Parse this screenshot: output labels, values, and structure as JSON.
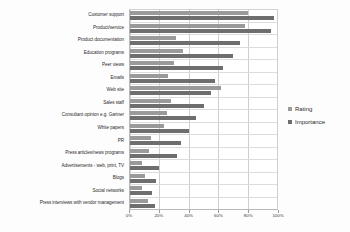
{
  "chart_data": {
    "type": "bar",
    "orientation": "horizontal",
    "title": "",
    "xlabel": "",
    "ylabel": "",
    "xlim": [
      0,
      100
    ],
    "xticks": [
      "0%",
      "20%",
      "40%",
      "60%",
      "80%",
      "100%"
    ],
    "xtick_values": [
      0,
      20,
      40,
      60,
      80,
      100
    ],
    "grid": true,
    "legend_position": "right",
    "categories": [
      "Customer support",
      "Product/service",
      "Product documentation",
      "Education programs",
      "Peer views",
      "Emails",
      "Web site",
      "Sales staff",
      "Consultant opinion e.g. Gartner",
      "White papers",
      "PR",
      "Press articles/news programs",
      "Advertisements - web, print, TV",
      "Blogs",
      "Social networks",
      "Press interviews with vendor management"
    ],
    "series": [
      {
        "name": "Rating",
        "color": "#9a9a9a",
        "values": [
          80,
          78,
          31,
          36,
          30,
          26,
          62,
          28,
          25,
          23,
          14,
          13,
          8,
          10,
          8,
          12
        ]
      },
      {
        "name": "Importance",
        "color": "#6e6e6e",
        "values": [
          98,
          96,
          75,
          70,
          63,
          58,
          55,
          50,
          45,
          40,
          35,
          32,
          20,
          18,
          15,
          17
        ]
      }
    ]
  },
  "legend": {
    "items": [
      {
        "label": "Rating",
        "color": "#9a9a9a"
      },
      {
        "label": "Importance",
        "color": "#6e6e6e"
      }
    ]
  }
}
